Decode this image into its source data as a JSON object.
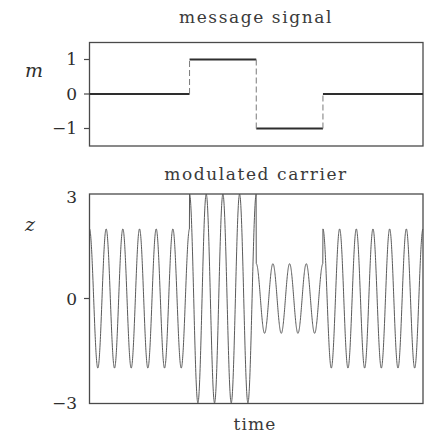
{
  "chart_data": [
    {
      "type": "line",
      "title": "message signal",
      "xlabel": "",
      "ylabel": "m",
      "xlim": [
        0,
        1
      ],
      "ylim": [
        -1.5,
        1.5
      ],
      "yticks": [
        1,
        0,
        -1
      ],
      "ytick_labels": [
        "1",
        "0",
        "−1"
      ],
      "grid": false,
      "series": [
        {
          "name": "m(t)",
          "style": "step",
          "x": [
            0,
            0.3,
            0.3,
            0.5,
            0.5,
            0.7,
            0.7,
            1.0
          ],
          "y": [
            0,
            0,
            1,
            1,
            -1,
            -1,
            0,
            0
          ]
        }
      ],
      "segments": [
        {
          "t_start": 0.0,
          "t_end": 0.3,
          "value": 0
        },
        {
          "t_start": 0.3,
          "t_end": 0.5,
          "value": 1
        },
        {
          "t_start": 0.5,
          "t_end": 0.7,
          "value": -1
        },
        {
          "t_start": 0.7,
          "t_end": 1.0,
          "value": 0
        }
      ]
    },
    {
      "type": "line",
      "title": "modulated carrier",
      "xlabel": "time",
      "ylabel": "z",
      "xlim": [
        0,
        1
      ],
      "ylim": [
        -3,
        3
      ],
      "yticks": [
        3,
        0,
        -3
      ],
      "ytick_labels": [
        "3",
        "0",
        "−3"
      ],
      "grid": false,
      "series": [
        {
          "name": "z(t) = (2 + m(t)) cos(2π f t)",
          "carrier_frequency_cycles": 20,
          "dc_offset": 2,
          "amplitude_by_segment": [
            {
              "t_start": 0.0,
              "t_end": 0.3,
              "amplitude": 2
            },
            {
              "t_start": 0.3,
              "t_end": 0.5,
              "amplitude": 3
            },
            {
              "t_start": 0.5,
              "t_end": 0.7,
              "amplitude": 1
            },
            {
              "t_start": 0.7,
              "t_end": 1.0,
              "amplitude": 2
            }
          ]
        }
      ]
    }
  ],
  "labels": {
    "top_title": "message signal",
    "top_ylabel": "m",
    "top_tick_1": "1",
    "top_tick_0": "0",
    "top_tick_m1": "−1",
    "bottom_title": "modulated carrier",
    "bottom_ylabel": "z",
    "bottom_tick_3": "3",
    "bottom_tick_0": "0",
    "bottom_tick_m3": "−3",
    "bottom_xlabel": "time"
  }
}
